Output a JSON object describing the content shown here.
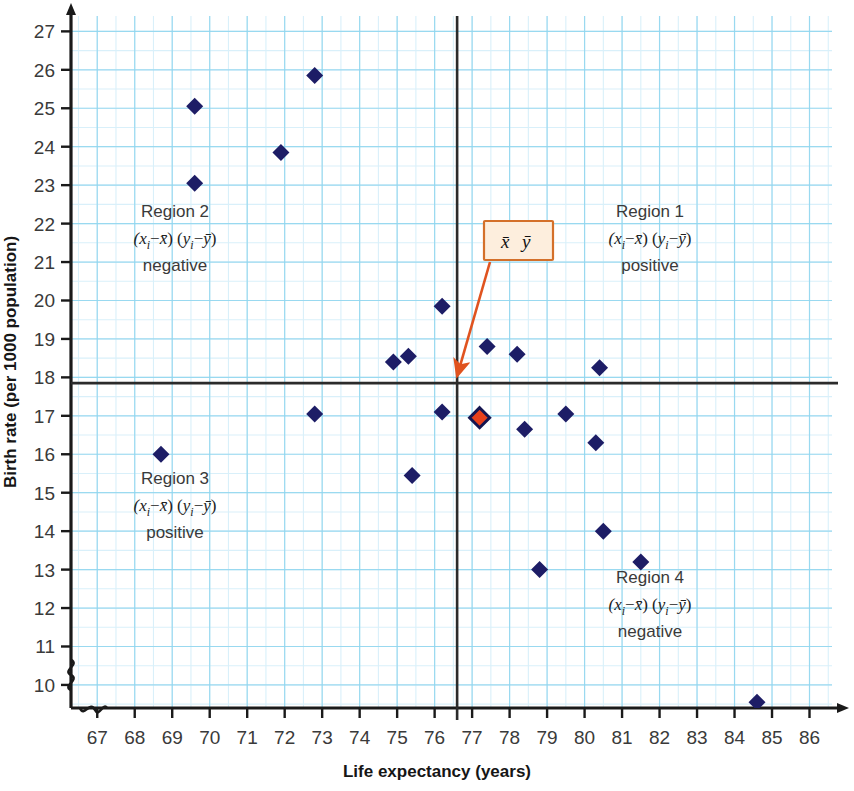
{
  "chart_data": {
    "type": "scatter",
    "title": "",
    "xlabel": "Life expectancy (years)",
    "ylabel": "Birth rate (per 1000 population)",
    "xlim": [
      66.3,
      86.6
    ],
    "ylim": [
      9.4,
      27.4
    ],
    "xticks": [
      67,
      68,
      69,
      70,
      71,
      72,
      73,
      74,
      75,
      76,
      77,
      78,
      79,
      80,
      81,
      82,
      83,
      84,
      85,
      86
    ],
    "yticks": [
      10,
      11,
      12,
      13,
      14,
      15,
      16,
      17,
      18,
      19,
      20,
      21,
      22,
      23,
      24,
      25,
      26,
      27
    ],
    "grid": true,
    "grid_minor_step_x": 0.5,
    "grid_minor_step_y": 0.5,
    "y_axis_break": true,
    "x_axis_break": true,
    "legend": "none",
    "points": [
      {
        "x": 68.7,
        "y": 16.0,
        "color": "#1d1d66"
      },
      {
        "x": 69.6,
        "y": 25.05,
        "color": "#1d1d66"
      },
      {
        "x": 69.6,
        "y": 23.05,
        "color": "#1d1d66"
      },
      {
        "x": 71.9,
        "y": 23.85,
        "color": "#1d1d66"
      },
      {
        "x": 72.8,
        "y": 25.85,
        "color": "#1d1d66"
      },
      {
        "x": 72.8,
        "y": 17.05,
        "color": "#1d1d66"
      },
      {
        "x": 74.9,
        "y": 18.4,
        "color": "#1d1d66"
      },
      {
        "x": 75.3,
        "y": 18.55,
        "color": "#1d1d66"
      },
      {
        "x": 75.4,
        "y": 15.45,
        "color": "#1d1d66"
      },
      {
        "x": 76.2,
        "y": 19.85,
        "color": "#1d1d66"
      },
      {
        "x": 76.2,
        "y": 17.1,
        "color": "#1d1d66"
      },
      {
        "x": 77.2,
        "y": 16.95,
        "color": "#e03a16",
        "highlight": true
      },
      {
        "x": 77.4,
        "y": 18.8,
        "color": "#1d1d66"
      },
      {
        "x": 78.2,
        "y": 18.6,
        "color": "#1d1d66"
      },
      {
        "x": 78.4,
        "y": 16.65,
        "color": "#1d1d66"
      },
      {
        "x": 78.8,
        "y": 13.0,
        "color": "#1d1d66"
      },
      {
        "x": 79.5,
        "y": 17.05,
        "color": "#1d1d66"
      },
      {
        "x": 80.3,
        "y": 16.3,
        "color": "#1d1d66"
      },
      {
        "x": 80.4,
        "y": 18.25,
        "color": "#1d1d66"
      },
      {
        "x": 80.5,
        "y": 14.0,
        "color": "#1d1d66"
      },
      {
        "x": 81.5,
        "y": 13.2,
        "color": "#1d1d66"
      },
      {
        "x": 84.6,
        "y": 9.55,
        "color": "#1d1d66"
      }
    ],
    "mean_lines": {
      "x_mean": 76.6,
      "y_mean": 17.85,
      "color": "#2b2b2b"
    },
    "annotations": {
      "callout": {
        "label": "x̄ ȳ",
        "x_symbol": "x",
        "y_symbol": "y",
        "border_color": "#d4702a",
        "fill_color": "#fdeedd",
        "arrow_color": "#e0531f",
        "target_x": 76.6,
        "target_y": 17.85
      },
      "regions": [
        {
          "id": "region-1",
          "title": "Region 1",
          "formula_left": "(x",
          "formula_sub1": "i",
          "formula_mid": "−x̄) (y",
          "formula_sub2": "i",
          "formula_right": "−ȳ)",
          "sign": "positive",
          "quadrant": "top-right"
        },
        {
          "id": "region-2",
          "title": "Region 2",
          "sign": "negative",
          "quadrant": "top-left"
        },
        {
          "id": "region-3",
          "title": "Region 3",
          "sign": "positive",
          "quadrant": "bottom-left"
        },
        {
          "id": "region-4",
          "title": "Region 4",
          "sign": "negative",
          "quadrant": "bottom-right"
        }
      ]
    },
    "colors": {
      "marker": "#1d1d66",
      "marker_highlight_fill": "#e8401a",
      "marker_highlight_stroke": "#151550",
      "grid_major": "#8fd6ef",
      "grid_minor": "#d9f0fa",
      "axis": "#1a1a1a",
      "mean_line": "#2b2b2b"
    }
  }
}
